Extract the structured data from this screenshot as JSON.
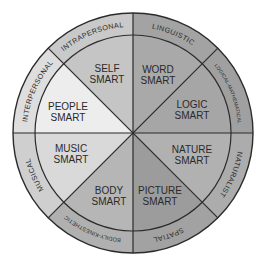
{
  "diagram": {
    "center": [
      133,
      133
    ],
    "outer_radius": 120,
    "inner_radius": 98,
    "sectors": [
      {
        "id": "word",
        "line1": "WORD",
        "line2": "SMART",
        "intelligence": "LINGUISTIC",
        "fill": "#a9a9a9",
        "ring_fill": "#a3a3a3"
      },
      {
        "id": "logic",
        "line1": "LOGIC",
        "line2": "SMART",
        "intelligence": "LOGICAL-MATHEMATICAL",
        "fill": "#a6a6a6",
        "ring_fill": "#a0a0a0"
      },
      {
        "id": "nature",
        "line1": "NATURE",
        "line2": "SMART",
        "intelligence": "NATURALIST",
        "fill": "#b1b1b1",
        "ring_fill": "#acacac"
      },
      {
        "id": "picture",
        "line1": "PICTURE",
        "line2": "SMART",
        "intelligence": "SPATIAL",
        "fill": "#9c9c9c",
        "ring_fill": "#a2a2a2"
      },
      {
        "id": "body",
        "line1": "BODY",
        "line2": "SMART",
        "intelligence": "BODILY-KINESTHETIC",
        "fill": "#b6b6b6",
        "ring_fill": "#b0b0b0"
      },
      {
        "id": "music",
        "line1": "MUSIC",
        "line2": "SMART",
        "intelligence": "MUSICAL",
        "fill": "#d9d9d9",
        "ring_fill": "#cfcfcf"
      },
      {
        "id": "people",
        "line1": "PEOPLE",
        "line2": "SMART",
        "intelligence": "INTERPERSONAL",
        "fill": "#ededed",
        "ring_fill": "#dedede"
      },
      {
        "id": "self",
        "line1": "SELF",
        "line2": "SMART",
        "intelligence": "INTRAPERSONAL",
        "fill": "#c5c5c5",
        "ring_fill": "#c9c9c9"
      }
    ],
    "stroke_color": "#2b2b2b"
  }
}
